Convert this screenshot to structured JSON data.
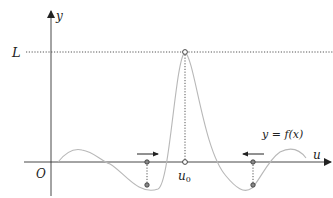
{
  "diagram": {
    "axes": {
      "x_label": "u",
      "y_label": "y",
      "origin_label": "O"
    },
    "limit_label": "L",
    "point_label": "u",
    "point_subscript": "0",
    "curve_label": "y = f(x)",
    "colors": {
      "axis": "#333333",
      "curve": "#b8b8b8",
      "dotted": "#555555",
      "marker_fill": "#888888"
    },
    "arrows": [
      {
        "direction": "right",
        "meaning": "approach from left"
      },
      {
        "direction": "left",
        "meaning": "approach from right"
      }
    ]
  }
}
